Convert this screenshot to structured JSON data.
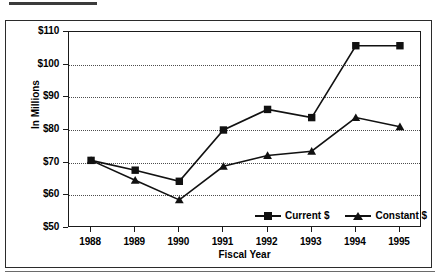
{
  "figure": {
    "top_rule_present": true,
    "frame_color": "#2b2b2b",
    "plot_line_color": "#111111",
    "grid_color": "#4d4d4d"
  },
  "chart_data": {
    "type": "line",
    "title": "",
    "xlabel": "Fiscal Year",
    "ylabel": "In Millions",
    "categories": [
      "1988",
      "1989",
      "1990",
      "1991",
      "1992",
      "1993",
      "1994",
      "1995"
    ],
    "ylim": [
      50,
      110
    ],
    "yticks": [
      50,
      60,
      70,
      80,
      90,
      100,
      110
    ],
    "ytick_labels": [
      "$50",
      "$60",
      "$70",
      "$80",
      "$90",
      "$100",
      "$110"
    ],
    "grid": "horizontal-dotted",
    "legend_position": "inside-bottom-center",
    "series": [
      {
        "name": "Current $",
        "marker": "square",
        "color": "#111111",
        "values": [
          70.7,
          67.7,
          64.3,
          80.0,
          86.3,
          83.8,
          105.8,
          105.8
        ]
      },
      {
        "name": "Constant $",
        "marker": "triangle",
        "color": "#111111",
        "values": [
          70.7,
          64.6,
          58.6,
          68.9,
          72.2,
          73.5,
          83.8,
          81.0
        ]
      }
    ]
  },
  "legend": {
    "entries": [
      {
        "label": "Current $",
        "marker": "square"
      },
      {
        "label": "Constant $",
        "marker": "triangle"
      }
    ]
  }
}
